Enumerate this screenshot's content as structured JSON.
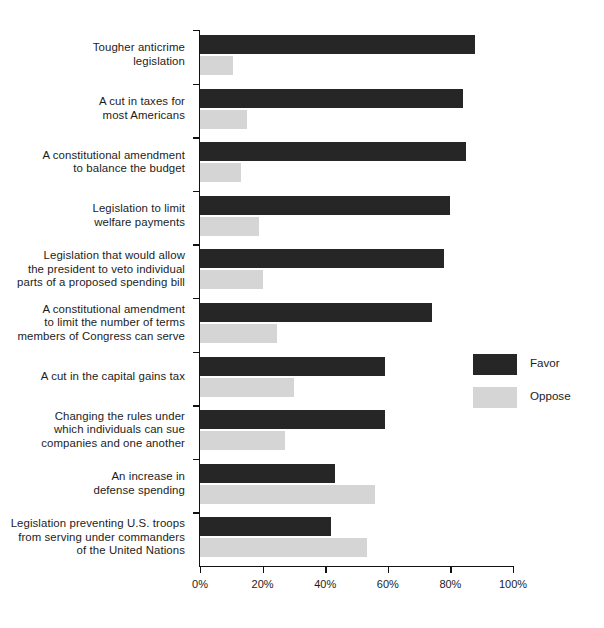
{
  "chart_data": {
    "type": "bar",
    "orientation": "horizontal",
    "title": "",
    "subtitle": "",
    "xlabel": "",
    "ylabel": "",
    "xlim": [
      0,
      100
    ],
    "xticks": [
      "0%",
      "20%",
      "40%",
      "60%",
      "80%",
      "100%"
    ],
    "xtick_values": [
      0,
      20,
      40,
      60,
      80,
      100
    ],
    "grid": false,
    "legend_position": "right",
    "categories": [
      "Tougher anticrime legislation",
      "A cut in taxes for most Americans",
      "A constitutional amendment to balance the budget",
      "Legislation to limit welfare payments",
      "Legislation that would allow the president to veto individual parts of a proposed spending bill",
      "A constitutional amendment to limit the number of terms members of Congress can serve",
      "A cut in the capital gains tax",
      "Changing the rules under which individuals can sue companies and one another",
      "An increase in defense spending",
      "Legislation preventing U.S. troops from serving under commanders of the United Nations"
    ],
    "category_lines": [
      [
        "Tougher anticrime",
        "legislation"
      ],
      [
        "A cut in taxes for",
        "most Americans"
      ],
      [
        "A constitutional amendment",
        "to balance the budget"
      ],
      [
        "Legislation to limit",
        "welfare payments"
      ],
      [
        "Legislation that would allow",
        "the president to veto individual",
        "parts of a proposed spending bill"
      ],
      [
        "A constitutional amendment",
        "to limit the number of terms",
        "members of Congress can serve"
      ],
      [
        "A cut in the capital gains tax"
      ],
      [
        "Changing the rules under",
        "which individuals can sue",
        "companies and one another"
      ],
      [
        "An increase in",
        "defense spending"
      ],
      [
        "Legislation preventing U.S. troops",
        "from serving under commanders",
        "of the United Nations"
      ]
    ],
    "series": [
      {
        "name": "Favor",
        "color": "#262626",
        "values": [
          88,
          84,
          85,
          80,
          78,
          74,
          59,
          59,
          43,
          42
        ]
      },
      {
        "name": "Oppose",
        "color": "#d5d5d5",
        "values": [
          10.5,
          15,
          13,
          19,
          20,
          24.5,
          30,
          27,
          56,
          53.5
        ]
      }
    ]
  },
  "legend": {
    "items": [
      {
        "label": "Favor",
        "color": "#262626"
      },
      {
        "label": "Oppose",
        "color": "#d5d5d5"
      }
    ]
  }
}
